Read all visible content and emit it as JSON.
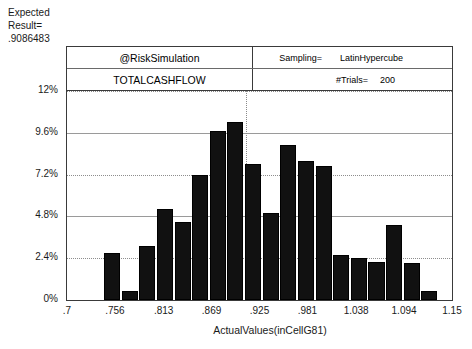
{
  "expected": {
    "line1": "Expected",
    "line2": "Result=",
    "line3": ".9086483"
  },
  "header": {
    "title": "@RiskSimulation",
    "variable": "TOTALCASHFLOW",
    "sampling_key": "Sampling=",
    "sampling_value": "LatinHypercube",
    "trials_key": "#Trials=",
    "trials_value": "200"
  },
  "chart_data": {
    "type": "bar",
    "title": "@RiskSimulation",
    "subtitle": "TOTALCASHFLOW",
    "xlabel": "ActualValues(inCellG81)",
    "ylabel": "",
    "ylim": [
      0,
      12
    ],
    "xlim": [
      0.7,
      1.15
    ],
    "grid": true,
    "legend": null,
    "y_ticks": [
      "0%",
      "2.4%",
      "4.8%",
      "7.2%",
      "9.6%",
      "12%"
    ],
    "y_tick_values": [
      0,
      2.4,
      4.8,
      7.2,
      9.6,
      12
    ],
    "x_ticks": [
      ".7",
      ".756",
      ".813",
      ".869",
      ".925",
      ".981",
      "1.038",
      "1.094",
      "1.15"
    ],
    "x_tick_values": [
      0.7,
      0.756,
      0.813,
      0.869,
      0.925,
      0.981,
      1.038,
      1.094,
      1.15
    ],
    "bin_centers": [
      0.768,
      0.79,
      0.812,
      0.834,
      0.856,
      0.878,
      0.9,
      0.922,
      0.944,
      0.966,
      0.988,
      1.01,
      1.032,
      1.054,
      1.076,
      1.098,
      1.12,
      1.142,
      1.16
    ],
    "values": [
      2.7,
      0.5,
      3.1,
      5.2,
      4.5,
      7.2,
      9.7,
      10.2,
      7.8,
      5.0,
      8.9,
      8.0,
      7.7,
      2.6,
      2.4,
      2.2,
      4.3,
      2.1,
      0.5
    ],
    "bar_color": "#111111",
    "vertical_marker": 0.9086483
  }
}
